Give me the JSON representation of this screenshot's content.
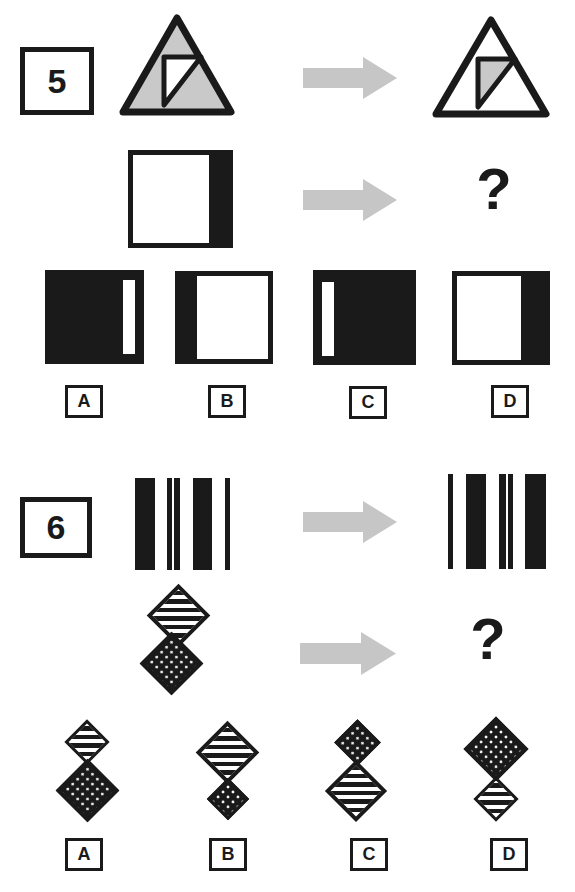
{
  "palette": {
    "ink": "#1a1a1a",
    "triangle_gray": "#c9c9c9",
    "arrow_gray": "#c6c6c6",
    "background": "#ffffff"
  },
  "questions": [
    {
      "number": "5",
      "question_mark": "?",
      "example": {
        "left": "gray-triangle-with-white-inner-right-triangle",
        "right": "white-triangle-with-gray-inner-right-triangle"
      },
      "stem": "white-square-with-black-band-on-right",
      "options": [
        {
          "letter": "A",
          "figure": "black-square-with-white-strip-near-right"
        },
        {
          "letter": "B",
          "figure": "white-square-with-black-band-on-left"
        },
        {
          "letter": "C",
          "figure": "black-square-with-white-strip-near-left"
        },
        {
          "letter": "D",
          "figure": "white-square-with-black-band-on-right"
        }
      ]
    },
    {
      "number": "6",
      "question_mark": "?",
      "example": {
        "left": "black-square-three-white-bars-seam-left-of-center",
        "right": "black-square-three-white-bars-seam-right-of-center"
      },
      "stem": "small-striped-diamond-above-large-dotted-diamond",
      "options": [
        {
          "letter": "A",
          "figure": "small-striped-diamond-above-large-dotted-diamond"
        },
        {
          "letter": "B",
          "figure": "large-striped-diamond-above-small-dotted-diamond"
        },
        {
          "letter": "C",
          "figure": "small-dotted-diamond-above-large-striped-diamond"
        },
        {
          "letter": "D",
          "figure": "large-dotted-diamond-above-small-striped-diamond"
        }
      ]
    }
  ]
}
